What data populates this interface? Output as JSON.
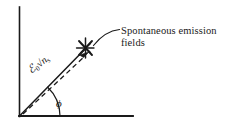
{
  "figure": {
    "kind": "phasor-vector-diagram",
    "background_color": "#ffffff",
    "ink_color": "#1a1a1a"
  },
  "axes": {
    "vertical_axis": {
      "name": "vertical-axis",
      "x": 19,
      "y_top": 7,
      "y_bottom": 116
    },
    "horizontal_axis": {
      "name": "horizontal-axis",
      "y": 116,
      "x_left": 19,
      "x_right": 133
    }
  },
  "vector": {
    "label_script_e": "ℰ",
    "label_subscript_zero": "0",
    "label_sqrt": "√",
    "label_radicand": "n",
    "label_radicand_subscript": "s",
    "origin_x": 19,
    "origin_y": 116,
    "tip_x": 86,
    "tip_y": 48,
    "angle_label": "ϕ",
    "angle_degrees": 45
  },
  "perturbation": {
    "name": "dashed-perturbation-vector",
    "style": "dashed-with-arrowhead",
    "origin_x": 23,
    "origin_y": 114,
    "tip_x": 88,
    "tip_y": 54
  },
  "marker": {
    "name": "spontaneous-emission-star",
    "glyph": "star-burst",
    "x": 86,
    "y": 48
  },
  "annotation": {
    "line1": "Spontaneous emission",
    "line2": "fields",
    "leader_from_x": 120,
    "leader_from_y": 31,
    "leader_to_x": 92,
    "leader_to_y": 47
  }
}
